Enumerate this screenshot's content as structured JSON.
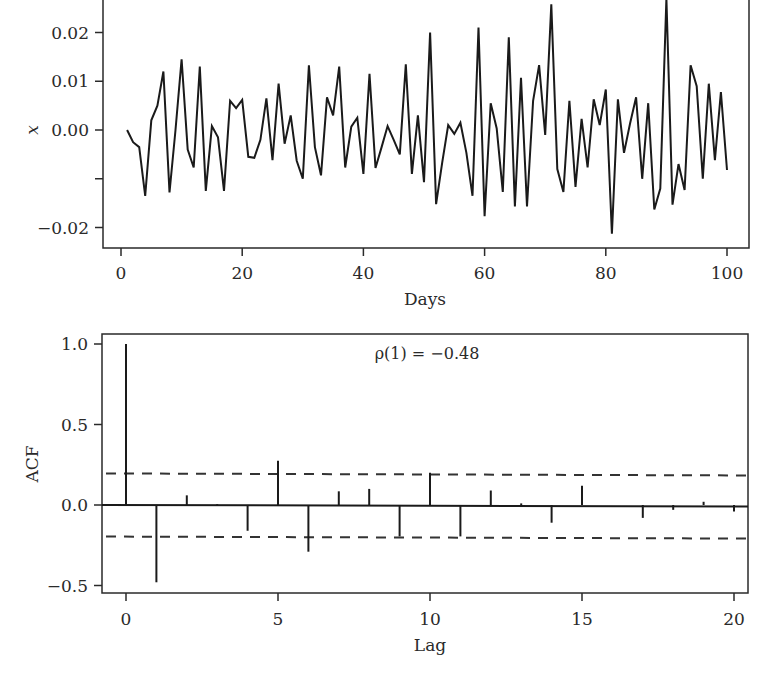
{
  "chart_data": [
    {
      "type": "line",
      "title": "",
      "xlabel": "Days",
      "ylabel": "x",
      "xlim": [
        -3,
        104
      ],
      "ylim": [
        -0.024,
        0.0267
      ],
      "xticks": [
        0,
        20,
        40,
        60,
        80,
        100
      ],
      "xtick_labels": [
        "0",
        "20",
        "40",
        "60",
        "80",
        "100"
      ],
      "yticks": [
        -0.02,
        -0.01,
        0.0,
        0.01,
        0.02
      ],
      "ytick_labels": [
        "−0.02",
        "",
        "0.00",
        "0.01",
        "0.02"
      ],
      "grid": false,
      "series": [
        {
          "name": "x",
          "x": [
            1,
            2,
            3,
            4,
            5,
            6,
            7,
            8,
            9,
            10,
            11,
            12,
            13,
            14,
            15,
            16,
            17,
            18,
            19,
            20,
            21,
            22,
            23,
            24,
            25,
            26,
            27,
            28,
            29,
            30,
            31,
            32,
            33,
            34,
            35,
            36,
            37,
            38,
            39,
            40,
            41,
            42,
            43,
            44,
            45,
            46,
            47,
            48,
            49,
            50,
            51,
            52,
            53,
            54,
            55,
            56,
            57,
            58,
            59,
            60,
            61,
            62,
            63,
            64,
            65,
            66,
            67,
            68,
            69,
            70,
            71,
            72,
            73,
            74,
            75,
            76,
            77,
            78,
            79,
            80,
            81,
            82,
            83,
            84,
            85,
            86,
            87,
            88,
            89,
            90,
            91,
            92,
            93,
            94,
            95,
            96,
            97,
            98,
            99,
            100
          ],
          "values": [
            0.0,
            -0.0025,
            -0.0035,
            -0.0135,
            0.002,
            0.005,
            0.012,
            -0.0128,
            0.0,
            0.0145,
            -0.004,
            -0.0077,
            0.013,
            -0.0125,
            0.0008,
            -0.0015,
            -0.0125,
            0.006,
            0.0045,
            0.0062,
            -0.0055,
            -0.0057,
            -0.002,
            0.0065,
            -0.0062,
            0.0095,
            -0.0028,
            0.003,
            -0.0063,
            -0.01,
            0.0133,
            -0.0035,
            -0.0093,
            0.0067,
            0.003,
            0.013,
            -0.0077,
            0.0007,
            0.0025,
            -0.009,
            0.0115,
            -0.0078,
            -0.0035,
            0.0008,
            -0.002,
            -0.005,
            0.0135,
            -0.009,
            0.003,
            -0.0107,
            0.02,
            -0.0152,
            -0.0067,
            0.001,
            -0.0008,
            0.0015,
            -0.0047,
            -0.0135,
            0.021,
            -0.0177,
            0.0055,
            0.0003,
            -0.0127,
            0.019,
            -0.0157,
            0.0107,
            -0.0157,
            0.006,
            0.0133,
            -0.001,
            0.0258,
            -0.008,
            -0.0127,
            0.006,
            -0.0117,
            0.0023,
            -0.0077,
            0.0063,
            0.001,
            0.0083,
            -0.0213,
            0.0063,
            -0.0047,
            0.0013,
            0.0067,
            -0.01,
            0.0055,
            -0.0163,
            -0.012,
            0.027,
            -0.0153,
            -0.007,
            -0.0123,
            0.0133,
            0.009,
            -0.01,
            0.0095,
            -0.0062,
            0.0078,
            -0.0082
          ]
        }
      ]
    },
    {
      "type": "bar",
      "subtype": "acf-stem",
      "title": "",
      "xlabel": "Lag",
      "ylabel": "ACF",
      "xlim": [
        -0.8,
        20.8
      ],
      "ylim": [
        -0.54,
        1.06
      ],
      "xticks": [
        0,
        5,
        10,
        15,
        20
      ],
      "xtick_labels": [
        "0",
        "5",
        "10",
        "15",
        "20"
      ],
      "yticks": [
        -0.5,
        0.0,
        0.5,
        1.0
      ],
      "ytick_labels": [
        "−0.5",
        "0.0",
        "0.5",
        "1.0"
      ],
      "grid": false,
      "categories": [
        0,
        1,
        2,
        3,
        4,
        5,
        6,
        7,
        8,
        9,
        10,
        11,
        12,
        13,
        14,
        15,
        16,
        17,
        18,
        19,
        20
      ],
      "values": [
        1.0,
        -0.48,
        0.06,
        0.005,
        -0.16,
        0.275,
        -0.29,
        0.085,
        0.1,
        -0.195,
        0.2,
        -0.195,
        0.09,
        0.01,
        -0.11,
        0.12,
        0.0,
        -0.08,
        -0.03,
        0.02,
        -0.04
      ],
      "confidence_bounds": [
        -0.196,
        0.196
      ],
      "annotations": [
        {
          "text": "ρ(1) = −0.48",
          "x": 10,
          "y": 0.95
        }
      ]
    }
  ]
}
